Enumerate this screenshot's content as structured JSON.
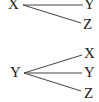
{
  "diagrams": [
    {
      "root": "X",
      "children": [
        "Y",
        "Z"
      ]
    },
    {
      "root": "Y",
      "children": [
        "X",
        "Y",
        "Z"
      ]
    }
  ],
  "colors": {
    "line": "#444444",
    "text": "#1a1a1a",
    "background": "#ffffff"
  }
}
